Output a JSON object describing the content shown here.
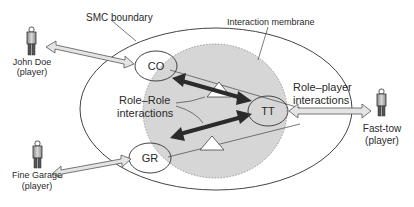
{
  "labels": {
    "smc_boundary": "SMC boundary",
    "interaction_membrane": "Interaction membrane",
    "role_role_line1": "Role–Role",
    "role_role_line2": "interactions",
    "role_player_line1": "Role–player",
    "role_player_line2": "interactions"
  },
  "roles": [
    {
      "id": "CO",
      "label": "CO"
    },
    {
      "id": "GR",
      "label": "GR"
    },
    {
      "id": "TT",
      "label": "TT"
    }
  ],
  "players": [
    {
      "name": "John Doe",
      "sub": "(player)"
    },
    {
      "name": "Fine Garage",
      "sub": "(player)"
    },
    {
      "name": "Fast-tow",
      "sub": "(player)"
    }
  ],
  "colors": {
    "membrane_fill": "#d6d6d6",
    "line": "#444444",
    "thick_arrow": "#2b2b2b",
    "hollow_arrow_fill": "#e4e4e4",
    "figure_fill": "#bdbdbd"
  }
}
